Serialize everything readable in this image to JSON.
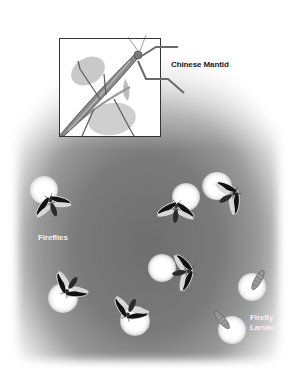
{
  "illustration": {
    "inset": {
      "label": "Chinese Mantid",
      "subject": "mantid-on-leaves"
    },
    "labels": {
      "fireflies": "Fireflies",
      "larvae_line1": "Firefly",
      "larvae_line2": "Larvae"
    },
    "colors": {
      "background_dark": "#6e6e6e",
      "glow": "#ffffff",
      "label_dark": "#1a1a1a",
      "label_light": "#f2f2f2"
    },
    "fireflies": [
      {
        "x": 50,
        "y": 205,
        "glow_x": 44,
        "glow_y": 190
      },
      {
        "x": 175,
        "y": 211,
        "glow_x": 186,
        "glow_y": 197
      },
      {
        "x": 230,
        "y": 196,
        "glow_x": 218,
        "glow_y": 186
      },
      {
        "x": 183,
        "y": 270,
        "glow_x": 162,
        "glow_y": 268
      },
      {
        "x": 70,
        "y": 285,
        "glow_x": 63,
        "glow_y": 298
      },
      {
        "x": 130,
        "y": 310,
        "glow_x": 135,
        "glow_y": 320
      }
    ],
    "larvae": [
      {
        "x": 258,
        "y": 280,
        "glow_x": 252,
        "glow_y": 288
      },
      {
        "x": 220,
        "y": 318,
        "glow_x": 232,
        "glow_y": 330
      }
    ]
  }
}
